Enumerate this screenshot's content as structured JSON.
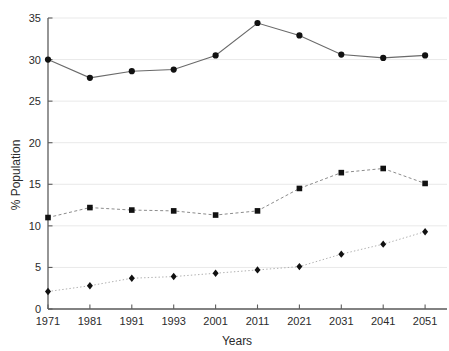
{
  "top_caption": "",
  "chart_data": {
    "type": "line",
    "title": "",
    "xlabel": "Years",
    "ylabel": "% Population",
    "categories": [
      "1971",
      "1981",
      "1991",
      "1993",
      "2001",
      "2011",
      "2021",
      "2031",
      "2041",
      "2051"
    ],
    "x": [
      1971,
      1981,
      1991,
      1993,
      2001,
      2011,
      2021,
      2031,
      2041,
      2051
    ],
    "ylim": [
      0,
      35
    ],
    "yticks": [
      0,
      5,
      10,
      15,
      20,
      25,
      30,
      35
    ],
    "ytick_labels": [
      "0",
      "5",
      "10",
      "15",
      "20",
      "25",
      "30",
      "35"
    ],
    "grid": true,
    "grid_axis": "y",
    "legend": "none",
    "series": [
      {
        "name": "series-1",
        "marker": "circle",
        "linestyle": "solid",
        "color": "#111111",
        "values": [
          30.0,
          27.8,
          28.6,
          28.8,
          30.5,
          34.4,
          32.9,
          30.6,
          30.2,
          30.5
        ]
      },
      {
        "name": "series-2",
        "marker": "square",
        "linestyle": "dashed",
        "color": "#111111",
        "values": [
          11.0,
          12.2,
          11.9,
          11.8,
          11.3,
          11.8,
          14.5,
          16.4,
          16.9,
          15.1
        ]
      },
      {
        "name": "series-3",
        "marker": "diamond",
        "linestyle": "dotted",
        "color": "#111111",
        "values": [
          2.1,
          2.8,
          3.7,
          3.9,
          4.3,
          4.7,
          5.1,
          6.6,
          7.8,
          9.3
        ]
      }
    ]
  }
}
